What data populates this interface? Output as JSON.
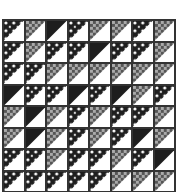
{
  "image": {
    "subject": "half-square-triangle quilt block grid",
    "rows": 8,
    "cols": 8,
    "colors": {
      "dark": "#1e1e1e",
      "light": "#ffffff",
      "border": "#333333"
    },
    "grid": [
      [
        "dots",
        "check",
        "solid",
        "dots",
        "check",
        "check",
        "dots",
        "check"
      ],
      [
        "dots",
        "check",
        "dots",
        "dots",
        "solid",
        "dots",
        "dots",
        "check"
      ],
      [
        "dots",
        "dots",
        "check",
        "check",
        "check",
        "check",
        "check",
        "check"
      ],
      [
        "solid",
        "dots",
        "dots",
        "solid",
        "dots",
        "solid",
        "check",
        "dots"
      ],
      [
        "check",
        "solid",
        "check",
        "dots",
        "check",
        "dots",
        "dots",
        "check"
      ],
      [
        "check",
        "solid",
        "check",
        "dots",
        "check",
        "dots",
        "solid",
        "check"
      ],
      [
        "dots",
        "dots",
        "check",
        "dots",
        "dots",
        "check",
        "dots",
        "solid"
      ],
      [
        "dots",
        "dots",
        "dots",
        "dots",
        "dots",
        "check",
        "check",
        "check"
      ]
    ]
  }
}
